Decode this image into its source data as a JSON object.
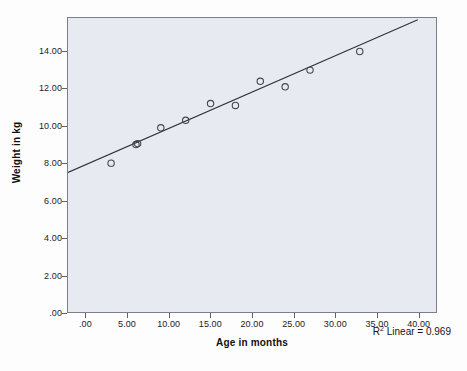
{
  "chart_data": {
    "type": "scatter",
    "title": "",
    "xlabel": "Age in months",
    "ylabel": "Weight in kg",
    "xlim": [
      -2.2,
      42.2
    ],
    "ylim": [
      0,
      15.8
    ],
    "grid": false,
    "legend": "none",
    "x_ticks": [
      ".00",
      "5.00",
      "10.00",
      "15.00",
      "20.00",
      "25.00",
      "30.00",
      "35.00",
      "40.00"
    ],
    "x_tick_values": [
      0,
      5,
      10,
      15,
      20,
      25,
      30,
      35,
      40
    ],
    "y_ticks": [
      ".00",
      "2.00",
      "4.00",
      "6.00",
      "8.00",
      "10.00",
      "12.00",
      "14.00"
    ],
    "y_tick_values": [
      0,
      2,
      4,
      6,
      8,
      10,
      12,
      14
    ],
    "points": [
      {
        "x": 3,
        "y": 8.0
      },
      {
        "x": 6,
        "y": 9.0
      },
      {
        "x": 6.2,
        "y": 9.05
      },
      {
        "x": 9,
        "y": 9.9
      },
      {
        "x": 12,
        "y": 10.3
      },
      {
        "x": 15,
        "y": 11.2
      },
      {
        "x": 18,
        "y": 11.1
      },
      {
        "x": 21,
        "y": 12.4
      },
      {
        "x": 24,
        "y": 12.1
      },
      {
        "x": 27,
        "y": 13.0
      },
      {
        "x": 33,
        "y": 14.0
      }
    ],
    "fit_line": {
      "type": "linear",
      "x_start": -2.2,
      "y_start": 7.5,
      "x_end": 40.0,
      "y_end": 15.7,
      "slope": 0.194,
      "intercept": 7.93
    },
    "annotation": {
      "prefix": "R",
      "superscript": "2",
      "text": " Linear = 0.969",
      "r_squared": 0.969
    },
    "colors": {
      "plot_background": "#e7eaf0",
      "page_background": "#fdfdfd",
      "axis": "#7b7f8a",
      "marker_edge": "#43474f",
      "line": "#31343b",
      "text": "#151515"
    }
  }
}
